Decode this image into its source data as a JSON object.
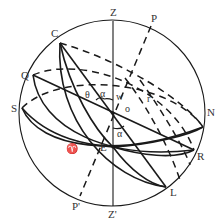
{
  "diagram": {
    "labels": {
      "zenith": "Z",
      "nadir": "Z'",
      "north_pole": "P",
      "south_pole": "P'",
      "C": "C",
      "Q": "Q",
      "south_point": "S",
      "north_point": "N",
      "R": "R",
      "L": "L",
      "center": "o",
      "E": "E",
      "theta": "θ",
      "alpha_upper": "α",
      "alpha_lower": "α",
      "w": "w",
      "r": "r",
      "vernal_equinox": "♈"
    },
    "colors": {
      "line": "#1a1a1a",
      "text": "#333333",
      "background": "#ffffff"
    }
  }
}
